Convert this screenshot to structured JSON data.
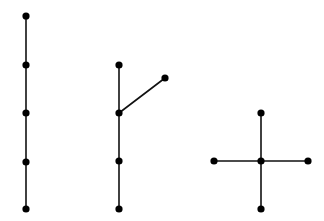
{
  "diagram": {
    "type": "graph-trees",
    "background": "#ffffff",
    "stroke_color": "#111111",
    "node_color": "#000000",
    "node_radius": 3.6,
    "graphs": [
      {
        "name": "path-5",
        "nodes": [
          {
            "id": "a1",
            "x": 26,
            "y": 16
          },
          {
            "id": "a2",
            "x": 26,
            "y": 65
          },
          {
            "id": "a3",
            "x": 26,
            "y": 113
          },
          {
            "id": "a4",
            "x": 26,
            "y": 162
          },
          {
            "id": "a5",
            "x": 26,
            "y": 209
          }
        ],
        "edges": [
          [
            "a1",
            "a2"
          ],
          [
            "a2",
            "a3"
          ],
          [
            "a3",
            "a4"
          ],
          [
            "a4",
            "a5"
          ]
        ]
      },
      {
        "name": "branched-tree",
        "nodes": [
          {
            "id": "b1",
            "x": 119,
            "y": 65
          },
          {
            "id": "b2",
            "x": 119,
            "y": 113
          },
          {
            "id": "b3",
            "x": 119,
            "y": 161
          },
          {
            "id": "b4",
            "x": 119,
            "y": 209
          },
          {
            "id": "b5",
            "x": 165,
            "y": 78
          }
        ],
        "edges": [
          [
            "b1",
            "b2"
          ],
          [
            "b2",
            "b3"
          ],
          [
            "b3",
            "b4"
          ],
          [
            "b2",
            "b5"
          ]
        ]
      },
      {
        "name": "star-5",
        "nodes": [
          {
            "id": "c1",
            "x": 261,
            "y": 113
          },
          {
            "id": "c2",
            "x": 214,
            "y": 161
          },
          {
            "id": "c3",
            "x": 261,
            "y": 161
          },
          {
            "id": "c4",
            "x": 308,
            "y": 161
          },
          {
            "id": "c5",
            "x": 261,
            "y": 209
          }
        ],
        "edges": [
          [
            "c1",
            "c3"
          ],
          [
            "c2",
            "c3"
          ],
          [
            "c3",
            "c4"
          ],
          [
            "c3",
            "c5"
          ]
        ]
      }
    ]
  }
}
